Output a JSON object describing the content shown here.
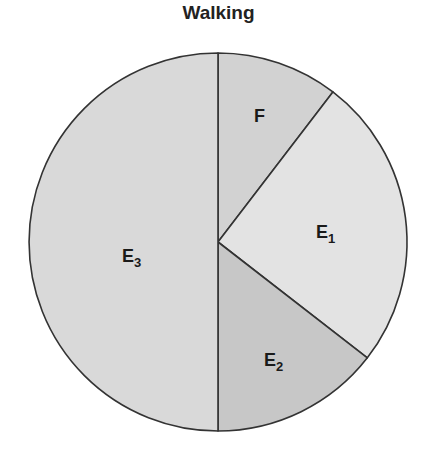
{
  "chart_data": {
    "type": "pie",
    "title": "Walking",
    "start_angle_deg": 0,
    "direction": "clockwise",
    "slices": [
      {
        "label": "F",
        "base": "F",
        "sub": "",
        "value": 10.4,
        "color": "#d2d2d2",
        "label_pos": [
          254,
          122
        ]
      },
      {
        "label": "E1",
        "base": "E",
        "sub": "1",
        "value": 25.1,
        "color": "#e3e3e3",
        "label_pos": [
          316,
          238
        ]
      },
      {
        "label": "E2",
        "base": "E",
        "sub": "2",
        "value": 14.5,
        "color": "#c7c7c7",
        "label_pos": [
          264,
          366
        ]
      },
      {
        "label": "E3",
        "base": "E",
        "sub": "3",
        "value": 50.0,
        "color": "#d9d9d9",
        "label_pos": [
          122,
          262
        ]
      }
    ],
    "legend": "none",
    "outline_color": "#333333",
    "center": [
      218,
      242
    ],
    "radius": 189
  }
}
